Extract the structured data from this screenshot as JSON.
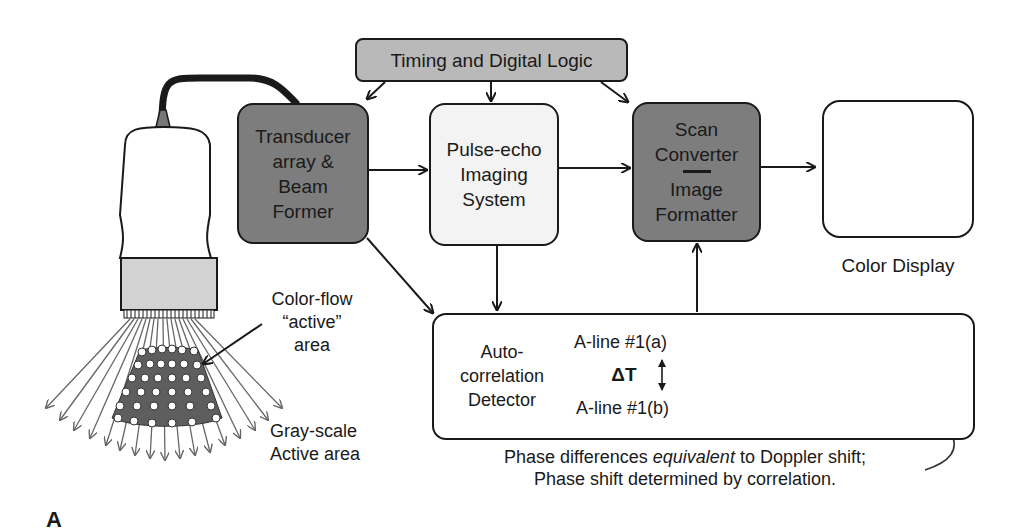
{
  "figure_label": "A",
  "colors": {
    "dark_box": "#7d7d7d",
    "mid_box": "#b9b9b9",
    "light_box": "#f3f3f3",
    "probe_head": "#d2d2d2",
    "outline": "#1a1a1a",
    "signal_a": "#555555",
    "signal_b": "#b0b0b0"
  },
  "blocks": {
    "timing": {
      "label": "Timing and Digital Logic"
    },
    "transducer": {
      "lines": [
        "Transducer",
        "array &",
        "Beam",
        "Former"
      ]
    },
    "pulse_echo": {
      "lines": [
        "Pulse-echo",
        "Imaging",
        "System"
      ]
    },
    "scan_converter": {
      "top_lines": [
        "Scan",
        "Converter"
      ],
      "bottom_lines": [
        "Image",
        "Formatter"
      ]
    },
    "display": {
      "caption": "Color Display"
    },
    "autocorrelation": {
      "lines": [
        "Auto-",
        "correlation",
        "Detector"
      ],
      "aline_a": "A-line #1(a)",
      "aline_b": "A-line #1(b)",
      "delta_t": "ΔT"
    }
  },
  "probe_labels": {
    "color_flow": [
      "Color-flow",
      "“active”",
      "area"
    ],
    "gray_scale": [
      "Gray-scale",
      "Active area"
    ]
  },
  "caption": {
    "line1_pre": "Phase differences ",
    "line1_em": "equivalent",
    "line1_post": " to Doppler shift;",
    "line2": "Phase shift determined by correlation."
  }
}
